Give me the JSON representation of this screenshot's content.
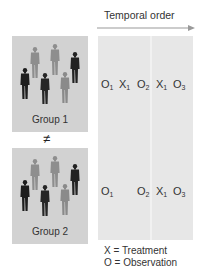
{
  "diagram": {
    "title_arrow": {
      "label": "Temporal order",
      "color": "#999999"
    },
    "groups": [
      {
        "label": "Group 1"
      },
      {
        "label": "Group 2"
      }
    ],
    "relation_symbol": "≠",
    "rows": [
      {
        "group": "Group 1",
        "tokens": [
          {
            "letter": "O",
            "sub": "1"
          },
          {
            "letter": "X",
            "sub": "1"
          },
          {
            "letter": "O",
            "sub": "2"
          },
          {
            "letter": "X",
            "sub": "1"
          },
          {
            "letter": "O",
            "sub": "3"
          }
        ]
      },
      {
        "group": "Group 2",
        "tokens": [
          {
            "letter": "O",
            "sub": "1"
          },
          {
            "letter": "O",
            "sub": "2"
          },
          {
            "letter": "X",
            "sub": "1"
          },
          {
            "letter": "O",
            "sub": "3"
          }
        ]
      }
    ],
    "legend": [
      {
        "text": "X = Treatment"
      },
      {
        "text": "O = Observation"
      }
    ],
    "colors": {
      "group_box": "#d2d2d2",
      "panel": "#e7e7e7",
      "figure_dark": "#222222",
      "figure_light": "#8a8a8a"
    }
  }
}
